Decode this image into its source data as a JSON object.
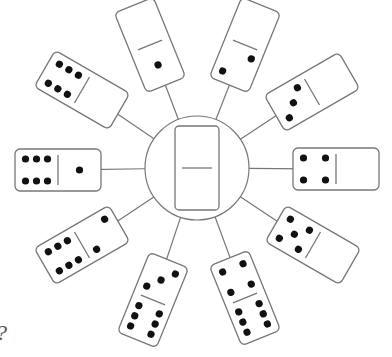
{
  "puzzle": {
    "question_mark": "?",
    "center": {
      "cx": 197,
      "cy": 168,
      "r": 52,
      "domino": {
        "top": "?",
        "bottom": "?"
      }
    },
    "stroke_color": "#777777",
    "pip_color": "#111111",
    "dominoes": [
      {
        "id": "top-left",
        "cx": 150,
        "cy": 45,
        "angle": -22,
        "orient": "v",
        "a": 0,
        "b": 1
      },
      {
        "id": "top-right",
        "cx": 245,
        "cy": 45,
        "angle": 22,
        "orient": "v",
        "a": 0,
        "b": 2
      },
      {
        "id": "upper-right",
        "cx": 312,
        "cy": 92,
        "angle": -30,
        "orient": "h",
        "a": 3,
        "b": 0
      },
      {
        "id": "right",
        "cx": 336,
        "cy": 169,
        "angle": 0,
        "orient": "h",
        "a": 4,
        "b": 0
      },
      {
        "id": "lower-right",
        "cx": 313,
        "cy": 245,
        "angle": 30,
        "orient": "h",
        "a": 5,
        "b": 0
      },
      {
        "id": "bottom-right",
        "cx": 245,
        "cy": 298,
        "angle": -22,
        "orient": "v",
        "a": 4,
        "b": 6
      },
      {
        "id": "bottom-left",
        "cx": 153,
        "cy": 300,
        "angle": 22,
        "orient": "v",
        "a": 3,
        "b": 6
      },
      {
        "id": "lower-left",
        "cx": 82,
        "cy": 245,
        "angle": -30,
        "orient": "h",
        "a": 6,
        "b": 2
      },
      {
        "id": "left",
        "cx": 58,
        "cy": 170,
        "angle": 0,
        "orient": "h",
        "a": 6,
        "b": 1
      },
      {
        "id": "upper-left",
        "cx": 82,
        "cy": 90,
        "angle": 30,
        "orient": "h",
        "a": 6,
        "b": 0
      }
    ]
  }
}
